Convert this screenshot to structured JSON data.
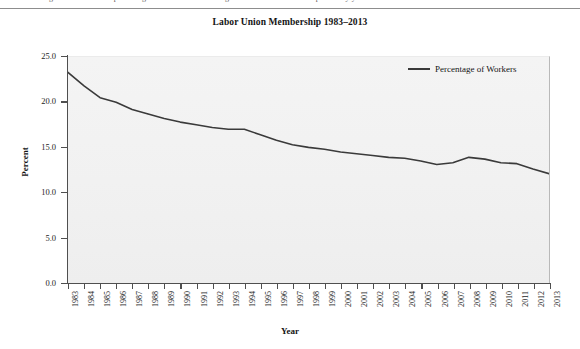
{
  "page": {
    "running_head_clipped": "Figure 5.3 shows the percentage of workers who belong to a labor union over the past thirty years."
  },
  "legend": {
    "entries": [
      {
        "label": "Percentage of Workers",
        "color": "#3a3a3a"
      }
    ]
  },
  "axis": {
    "y_title": "Percent",
    "x_title": "Year",
    "y_ticks": [
      "25.0",
      "20.0",
      "15.0",
      "10.0",
      "5.0",
      "0.0"
    ]
  },
  "chart_data": {
    "type": "line",
    "title": "Labor Union Membership 1983–2013",
    "xlabel": "Year",
    "ylabel": "Percent",
    "ylim": [
      0.0,
      25.0
    ],
    "ytick_values": [
      25.0,
      20.0,
      15.0,
      10.0,
      5.0,
      0.0
    ],
    "grid": false,
    "legend_position": "top-right",
    "x": [
      "1983",
      "1984",
      "1985",
      "1986",
      "1987",
      "1988",
      "1989",
      "1990",
      "1991",
      "1992",
      "1993",
      "1994",
      "1995",
      "1996",
      "1997",
      "1998",
      "1999",
      "2000",
      "2001",
      "2002",
      "2003",
      "2004",
      "2005",
      "2006",
      "2007",
      "2008",
      "2009",
      "2010",
      "2011",
      "2012",
      "2013"
    ],
    "series": [
      {
        "name": "Percentage of Workers",
        "color": "#3a3a3a",
        "values": [
          23.3,
          21.8,
          20.5,
          20.0,
          19.2,
          18.7,
          18.2,
          17.8,
          17.5,
          17.2,
          17.0,
          17.0,
          16.4,
          15.8,
          15.3,
          15.0,
          14.8,
          14.5,
          14.3,
          14.1,
          13.9,
          13.8,
          13.5,
          13.1,
          13.3,
          13.9,
          13.7,
          13.3,
          13.2,
          12.6,
          12.1
        ]
      }
    ]
  }
}
